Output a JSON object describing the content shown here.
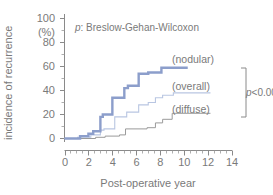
{
  "chart_data": {
    "type": "line",
    "title": "p: Breslow-Gehan-Wilcoxon",
    "title_italic_prefix": "p",
    "title_rest": ": Breslow-Gehan-Wilcoxon",
    "xlabel": "Post-operative year",
    "ylabel": "incidence of recurrence",
    "yunit": "(%)",
    "xlim": [
      0,
      14
    ],
    "ylim": [
      0,
      100
    ],
    "xticks": [
      0,
      2,
      4,
      6,
      8,
      10,
      12,
      14
    ],
    "xticklabels": [
      "0",
      "2",
      "4",
      "6",
      "8",
      "10",
      "12",
      "14"
    ],
    "x_minor_step": 0.5,
    "yticks": [
      0,
      20,
      40,
      60,
      80,
      100
    ],
    "yticklabels": [
      "0",
      "20",
      "40",
      "60",
      "80",
      "100"
    ],
    "grid": false,
    "legend_position": "inline-right",
    "annotations": [
      {
        "text": "p<0.001",
        "italic_prefix": "p",
        "rest": "<0.001"
      }
    ],
    "series": [
      {
        "name": "(nodular)",
        "color": "#8c9ecb",
        "linewidth": 2.4,
        "label": "(nodular)",
        "steps_x": [
          0,
          1.3,
          1.3,
          2.0,
          2.0,
          2.4,
          2.4,
          3.0,
          3.0,
          3.2,
          3.2,
          4.0,
          4.0,
          5.0,
          5.0,
          5.3,
          5.3,
          6.2,
          6.2,
          7.0,
          7.0,
          8.1,
          8.1,
          10.3
        ],
        "steps_y": [
          0,
          0,
          2,
          2,
          4,
          4,
          6,
          6,
          18,
          18,
          20,
          20,
          34,
          34,
          42,
          42,
          44,
          44,
          54,
          54,
          55,
          55,
          59,
          59
        ],
        "points": [
          {
            "x": 0,
            "y": 0
          },
          {
            "x": 1.3,
            "y": 2
          },
          {
            "x": 2.0,
            "y": 4
          },
          {
            "x": 2.4,
            "y": 6
          },
          {
            "x": 3.0,
            "y": 18
          },
          {
            "x": 3.2,
            "y": 20
          },
          {
            "x": 4.0,
            "y": 34
          },
          {
            "x": 5.0,
            "y": 42
          },
          {
            "x": 5.3,
            "y": 44
          },
          {
            "x": 6.2,
            "y": 54
          },
          {
            "x": 7.0,
            "y": 55
          },
          {
            "x": 8.1,
            "y": 59
          },
          {
            "x": 10.3,
            "y": 59
          }
        ]
      },
      {
        "name": "(overall)",
        "color": "#b9c6e2",
        "linewidth": 1.1,
        "label": "(overall)",
        "steps_x": [
          0,
          1.1,
          1.1,
          2.2,
          2.2,
          3.0,
          3.0,
          3.3,
          3.3,
          4.2,
          4.2,
          5.2,
          5.2,
          6.2,
          6.2,
          7.0,
          7.0,
          7.6,
          7.6,
          8.2,
          8.2,
          9.1,
          9.1,
          12.2
        ],
        "steps_y": [
          0,
          0,
          1,
          1,
          3,
          3,
          7,
          7,
          8,
          8,
          18,
          18,
          22,
          22,
          28,
          28,
          30,
          30,
          34,
          34,
          36,
          36,
          38,
          38
        ],
        "points": [
          {
            "x": 0,
            "y": 0
          },
          {
            "x": 1.1,
            "y": 1
          },
          {
            "x": 2.2,
            "y": 3
          },
          {
            "x": 3.0,
            "y": 7
          },
          {
            "x": 3.3,
            "y": 8
          },
          {
            "x": 4.2,
            "y": 18
          },
          {
            "x": 5.2,
            "y": 22
          },
          {
            "x": 6.2,
            "y": 28
          },
          {
            "x": 7.0,
            "y": 30
          },
          {
            "x": 7.6,
            "y": 34
          },
          {
            "x": 8.2,
            "y": 36
          },
          {
            "x": 9.1,
            "y": 38
          },
          {
            "x": 12.2,
            "y": 38
          }
        ]
      },
      {
        "name": "(diffuse)",
        "color": "#9a9a9a",
        "linewidth": 1.0,
        "label": "(diffuse)",
        "steps_x": [
          0,
          2.6,
          2.6,
          3.4,
          3.4,
          4.6,
          4.6,
          5.1,
          5.1,
          6.9,
          6.9,
          7.6,
          7.6,
          8.2,
          8.2,
          9.0,
          9.0,
          12.2
        ],
        "steps_y": [
          0,
          0,
          1,
          1,
          2,
          2,
          3,
          3,
          8,
          8,
          9,
          9,
          13,
          13,
          16,
          16,
          21,
          21
        ],
        "points": [
          {
            "x": 0,
            "y": 0
          },
          {
            "x": 2.6,
            "y": 1
          },
          {
            "x": 3.4,
            "y": 2
          },
          {
            "x": 4.6,
            "y": 3
          },
          {
            "x": 5.1,
            "y": 8
          },
          {
            "x": 6.9,
            "y": 9
          },
          {
            "x": 7.6,
            "y": 13
          },
          {
            "x": 8.2,
            "y": 16
          },
          {
            "x": 9.0,
            "y": 21
          },
          {
            "x": 12.2,
            "y": 21
          }
        ]
      }
    ]
  },
  "labels": {
    "ytick_100": "100",
    "ytick_80": "80",
    "ytick_60": "60",
    "ytick_40": "40",
    "ytick_20": "20",
    "ytick_0": "0",
    "percent": "(%)",
    "xtick_0": "0",
    "xtick_2": "2",
    "xtick_4": "4",
    "xtick_6": "6",
    "xtick_8": "8",
    "xtick_10": "10",
    "xtick_12": "12",
    "xtick_14": "14",
    "xaxis_title": "Post-operative year",
    "yaxis_title": "incidence of recurrence",
    "test_italic": "p",
    "test_rest": ": Breslow-Gehan-Wilcoxon",
    "legend_nodular": "(nodular)",
    "legend_overall": "(overall)",
    "legend_diffuse": "(diffuse)",
    "pval_italic": "p",
    "pval_rest": "<0.001"
  },
  "colors": {
    "nodular": "#8c9ecb",
    "overall": "#b9c6e2",
    "diffuse": "#9a9a9a",
    "axis": "#8a8a8a",
    "text": "#7a7a7a",
    "background": "#ffffff"
  }
}
